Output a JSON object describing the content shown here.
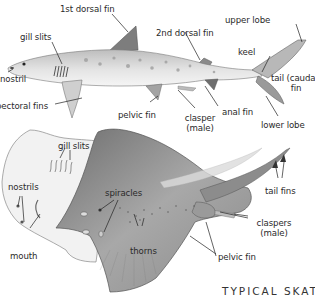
{
  "diagram": {
    "title": "TYPICAL SKATE",
    "shark": {
      "labels": {
        "first_dorsal_fin": "1st dorsal fin",
        "gill_slits": "gill slits",
        "nostril": "nostril",
        "pectoral_fins": "pectoral fins",
        "second_dorsal_fin": "2nd dorsal fin",
        "upper_lobe": "upper lobe",
        "keel": "keel",
        "tail_caudal_fin_line1": "tail (caudal)",
        "tail_caudal_fin_line2": "fin",
        "pelvic_fin": "pelvic fin",
        "clasper_line1": "clasper",
        "clasper_line2": "(male)",
        "anal_fin": "anal fin",
        "lower_lobe": "lower lobe"
      }
    },
    "skate": {
      "labels": {
        "gill_slits": "gill slits",
        "nostrils": "nostrils",
        "mouth": "mouth",
        "spiracles": "spiracles",
        "thorns": "thorns",
        "tail_fins": "tail fins",
        "claspers_line1": "claspers",
        "claspers_line2": "(male)",
        "pelvic_fin": "pelvic fin"
      }
    },
    "colors": {
      "background": "#ffffff",
      "shark_body": "#d8d8d8",
      "shark_dark": "#8a8a8a",
      "skate_body": "#9a9a9a",
      "skate_underside": "#efefef",
      "leader_line": "#222222",
      "label_text": "#2a2a2a"
    }
  }
}
